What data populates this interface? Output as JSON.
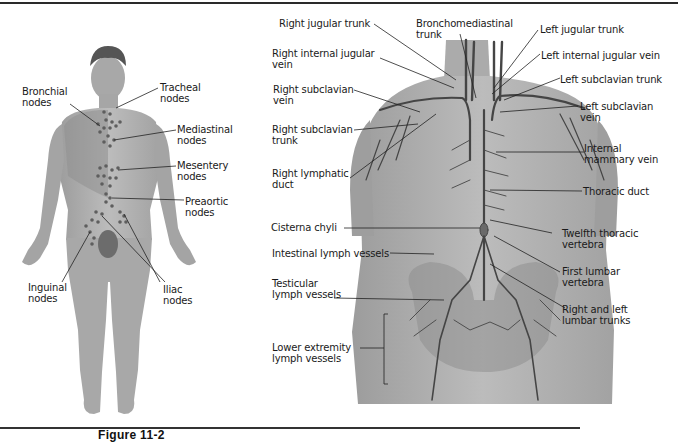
{
  "figure": {
    "caption": "Figure 11-2",
    "colors": {
      "skin": "#b4b4b4",
      "skin_dark": "#9a9a9a",
      "vessel": "#4a4a4a",
      "node": "#6a6a6a",
      "line": "#222222"
    }
  },
  "left_panel": {
    "labels": [
      {
        "id": "bronchial",
        "lines": [
          "Bronchial",
          "nodes"
        ]
      },
      {
        "id": "tracheal",
        "lines": [
          "Tracheal",
          "nodes"
        ]
      },
      {
        "id": "mediastinal",
        "lines": [
          "Mediastinal",
          "nodes"
        ]
      },
      {
        "id": "mesentery",
        "lines": [
          "Mesentery",
          "nodes"
        ]
      },
      {
        "id": "preaortic",
        "lines": [
          "Preaortic",
          "nodes"
        ]
      },
      {
        "id": "inguinal",
        "lines": [
          "Inguinal",
          "nodes"
        ]
      },
      {
        "id": "iliac",
        "lines": [
          "Iliac",
          "nodes"
        ]
      }
    ]
  },
  "right_panel": {
    "labels": [
      {
        "id": "right-jugular-trunk",
        "lines": [
          "Right jugular trunk"
        ]
      },
      {
        "id": "bronchomediastinal-trunk",
        "lines": [
          "Bronchomediastinal",
          "trunk"
        ]
      },
      {
        "id": "left-jugular-trunk",
        "lines": [
          "Left jugular trunk"
        ]
      },
      {
        "id": "right-internal-jugular-vein",
        "lines": [
          "Right internal jugular",
          "vein"
        ]
      },
      {
        "id": "left-internal-jugular-vein",
        "lines": [
          "Left internal jugular vein"
        ]
      },
      {
        "id": "left-subclavian-trunk",
        "lines": [
          "Left subclavian trunk"
        ]
      },
      {
        "id": "right-subclavian-vein",
        "lines": [
          "Right subclavian",
          "vein"
        ]
      },
      {
        "id": "left-subclavian-vein",
        "lines": [
          "Left subclavian",
          "vein"
        ]
      },
      {
        "id": "right-subclavian-trunk",
        "lines": [
          "Right subclavian",
          "trunk"
        ]
      },
      {
        "id": "internal-mammary-vein",
        "lines": [
          "Internal",
          "mammary vein"
        ]
      },
      {
        "id": "right-lymphatic-duct",
        "lines": [
          "Right lymphatic",
          "duct"
        ]
      },
      {
        "id": "thoracic-duct",
        "lines": [
          "Thoracic duct"
        ]
      },
      {
        "id": "cisterna-chyli",
        "lines": [
          "Cisterna chyli"
        ]
      },
      {
        "id": "twelfth-thoracic-vertebra",
        "lines": [
          "Twelfth thoracic",
          "vertebra"
        ]
      },
      {
        "id": "intestinal-lymph-vessels",
        "lines": [
          "Intestinal lymph vessels"
        ]
      },
      {
        "id": "first-lumbar-vertebra",
        "lines": [
          "First lumbar",
          "vertebra"
        ]
      },
      {
        "id": "testicular-lymph-vessels",
        "lines": [
          "Testicular",
          "lymph vessels"
        ]
      },
      {
        "id": "right-and-left-lumbar-trunks",
        "lines": [
          "Right and left",
          "lumbar trunks"
        ]
      },
      {
        "id": "lower-extremity-lymph-vessels",
        "lines": [
          "Lower extremity",
          "lymph vessels"
        ]
      }
    ]
  }
}
